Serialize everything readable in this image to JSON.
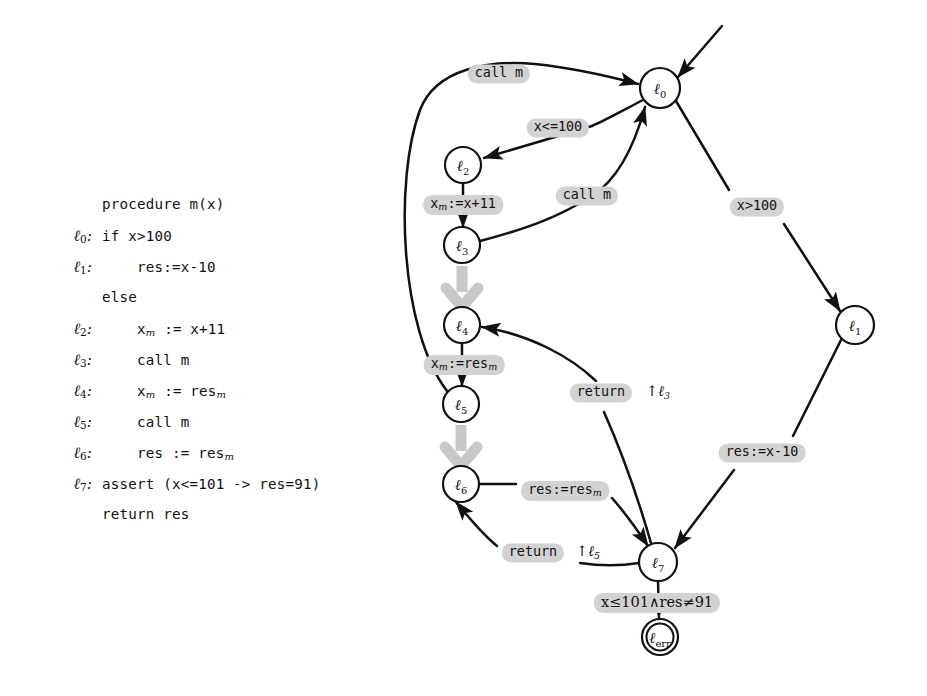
{
  "figure": {
    "kind": "control-flow-graph-with-code",
    "colors": {
      "background": "#ffffff",
      "ink": "#111111",
      "label_highlight": "#d2d2d2",
      "summary_edge": "#c8c8c8"
    }
  },
  "listing": {
    "title": "procedure m(x)",
    "rows": [
      {
        "label": "",
        "sub": "",
        "text": "procedure m(x)"
      },
      {
        "label": "ℓ",
        "sub": "0",
        "text": "if x>100"
      },
      {
        "label": "ℓ",
        "sub": "1",
        "text": "    res:=x-10"
      },
      {
        "label": "",
        "sub": "",
        "text": "else"
      },
      {
        "label": "ℓ",
        "sub": "2",
        "text": "    x<sub>m</sub> := x+11"
      },
      {
        "label": "ℓ",
        "sub": "3",
        "text": "    call m"
      },
      {
        "label": "ℓ",
        "sub": "4",
        "text": "    x<sub>m</sub> := res<sub>m</sub>"
      },
      {
        "label": "ℓ",
        "sub": "5",
        "text": "    call m"
      },
      {
        "label": "ℓ",
        "sub": "6",
        "text": "    res := res<sub>m</sub>"
      },
      {
        "label": "ℓ",
        "sub": "7",
        "text": "assert (x<=101 -> res=91)"
      },
      {
        "label": "",
        "sub": "",
        "text": "return res"
      }
    ],
    "lines_plain": [
      "procedure m(x)",
      "l0: if x>100",
      "l1:     res:=x-10",
      "else",
      "l2:     x_m := x+11",
      "l3:     call m",
      "l4:     x_m := res_m",
      "l5:     call m",
      "l6:     res := res_m",
      "l7: assert (x<=101 -> res=91)",
      "return res"
    ]
  },
  "graph": {
    "nodes": [
      {
        "id": "l0",
        "glyph": "ℓ",
        "sub": "0",
        "x": 660,
        "y": 88,
        "r": 20,
        "double": false
      },
      {
        "id": "l1",
        "glyph": "ℓ",
        "sub": "1",
        "x": 855,
        "y": 325,
        "r": 19,
        "double": false
      },
      {
        "id": "l2",
        "glyph": "ℓ",
        "sub": "2",
        "x": 463,
        "y": 165,
        "r": 18,
        "double": false
      },
      {
        "id": "l3",
        "glyph": "ℓ",
        "sub": "3",
        "x": 462,
        "y": 245,
        "r": 18,
        "double": false
      },
      {
        "id": "l4",
        "glyph": "ℓ",
        "sub": "4",
        "x": 462,
        "y": 325,
        "r": 18,
        "double": false
      },
      {
        "id": "l5",
        "glyph": "ℓ",
        "sub": "5",
        "x": 461,
        "y": 404,
        "r": 18,
        "double": false
      },
      {
        "id": "l6",
        "glyph": "ℓ",
        "sub": "6",
        "x": 461,
        "y": 484,
        "r": 18,
        "double": false
      },
      {
        "id": "l7",
        "glyph": "ℓ",
        "sub": "7",
        "x": 658,
        "y": 562,
        "r": 19,
        "double": false
      },
      {
        "id": "lerr",
        "glyph": "ℓ",
        "sub": "err",
        "x": 660,
        "y": 637,
        "r": 18,
        "double": true
      }
    ],
    "edge_labels": [
      {
        "id": "call-m-top",
        "text": "call m",
        "x": 499,
        "y": 74,
        "style": "highlight"
      },
      {
        "id": "x-le-100",
        "text": "x<=100",
        "x": 558,
        "y": 128,
        "style": "highlight"
      },
      {
        "id": "xm-assign",
        "text": "x<sub>m</sub>:=x+11",
        "x": 463,
        "y": 205,
        "style": "highlight"
      },
      {
        "id": "call-m-mid",
        "text": "call m",
        "x": 587,
        "y": 196,
        "style": "highlight"
      },
      {
        "id": "x-gt-100",
        "text": "x>100",
        "x": 757,
        "y": 207,
        "style": "highlight"
      },
      {
        "id": "xm-res",
        "text": "x<sub>m</sub>:=res<sub>m</sub>",
        "x": 464,
        "y": 365,
        "style": "highlight"
      },
      {
        "id": "return-l3",
        "text": "return",
        "x": 601,
        "y": 393,
        "style": "highlight"
      },
      {
        "id": "res-x-10",
        "text": "res:=x-10",
        "x": 762,
        "y": 453,
        "style": "highlight"
      },
      {
        "id": "res-resm",
        "text": "res:=res<sub>m</sub>",
        "x": 565,
        "y": 491,
        "style": "highlight"
      },
      {
        "id": "return-l5",
        "text": "return",
        "x": 533,
        "y": 553,
        "style": "highlight"
      },
      {
        "id": "assert-viol",
        "text": "x≤101∧res≠91",
        "x": 657,
        "y": 603,
        "style": "highlight math"
      }
    ],
    "plain_labels": [
      {
        "id": "uparrow-l3",
        "text": "↑ℓ",
        "sub": "3",
        "x": 658,
        "y": 392
      },
      {
        "id": "uparrow-l5",
        "text": "↑ℓ",
        "sub": "5",
        "x": 588,
        "y": 552
      }
    ],
    "edges": [
      {
        "from": "l5",
        "to": "l0",
        "label": "call-m-top",
        "kind": "call"
      },
      {
        "from": "l0",
        "to": "l2",
        "label": "x-le-100",
        "kind": "normal"
      },
      {
        "from": "l2",
        "to": "l3",
        "label": "xm-assign",
        "kind": "normal"
      },
      {
        "from": "l3",
        "to": "l0",
        "label": "call-m-mid",
        "kind": "call"
      },
      {
        "from": "l3",
        "to": "l4",
        "label": "",
        "kind": "summary"
      },
      {
        "from": "l4",
        "to": "l5",
        "label": "xm-res",
        "kind": "normal"
      },
      {
        "from": "l5",
        "to": "l6",
        "label": "",
        "kind": "summary"
      },
      {
        "from": "l6",
        "to": "l7",
        "label": "res-resm",
        "kind": "normal"
      },
      {
        "from": "l7",
        "to": "l4",
        "label": "return-l3",
        "kind": "return"
      },
      {
        "from": "l7",
        "to": "l6",
        "label": "return-l5",
        "kind": "return"
      },
      {
        "from": "l0",
        "to": "l1",
        "label": "x-gt-100",
        "kind": "normal"
      },
      {
        "from": "l1",
        "to": "l7",
        "label": "res-x-10",
        "kind": "normal"
      },
      {
        "from": "l7",
        "to": "lerr",
        "label": "assert-viol",
        "kind": "normal"
      },
      {
        "from": "entry",
        "to": "l0",
        "label": "",
        "kind": "entry"
      }
    ]
  }
}
